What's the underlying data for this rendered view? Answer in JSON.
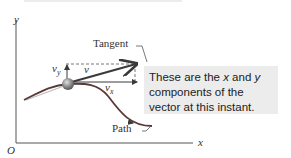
{
  "axes": {
    "y_label": "y",
    "x_label": "x",
    "origin_label": "O"
  },
  "labels": {
    "tangent": "Tangent",
    "path": "Path",
    "v": "v",
    "v_arrow": "→",
    "vy_main": "v",
    "vy_sub": "y",
    "vx_main": "v",
    "vx_sub": "x"
  },
  "callout": {
    "text_part1": "These are the ",
    "x": "x",
    "text_part2": " and ",
    "y": "y",
    "text_part3": " components of the vector at this instant."
  },
  "colors": {
    "path": "#5a3a38",
    "vector": "#3a3a3a",
    "callout_bg": "#ececec",
    "particle": "#8a8a8a"
  }
}
